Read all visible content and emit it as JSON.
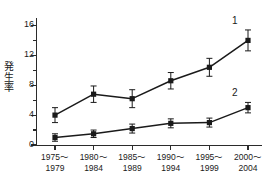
{
  "chart_data": {
    "type": "line",
    "title": "",
    "xlabel": "",
    "ylabel": "発生率",
    "ylim": [
      0,
      17
    ],
    "grid": false,
    "legend_position": "inline-right",
    "categories": [
      "1975~\n1979",
      "1980~\n1984",
      "1985~\n1989",
      "1990~\n1994",
      "1995~\n1999",
      "2000~\n2004"
    ],
    "category_lines": [
      [
        "1975〜",
        "1979"
      ],
      [
        "1980〜",
        "1984"
      ],
      [
        "1985〜",
        "1989"
      ],
      [
        "1990〜",
        "1994"
      ],
      [
        "1995〜",
        "1999"
      ],
      [
        "2000〜",
        "2004"
      ]
    ],
    "ytick_major": [
      0,
      4,
      8,
      12,
      16
    ],
    "ytick_minor": [
      2,
      6,
      10,
      14
    ],
    "series": [
      {
        "name": "1",
        "label": "1",
        "marker": "square",
        "color": "#1a1a1a",
        "values": [
          4.0,
          6.8,
          6.2,
          8.6,
          10.4,
          14.0
        ],
        "errors": [
          1.0,
          1.1,
          1.2,
          1.1,
          1.2,
          1.4
        ]
      },
      {
        "name": "2",
        "label": "2",
        "marker": "square",
        "color": "#1a1a1a",
        "values": [
          1.0,
          1.5,
          2.2,
          2.9,
          3.0,
          5.0
        ],
        "errors": [
          0.5,
          0.5,
          0.6,
          0.6,
          0.6,
          0.7
        ]
      }
    ]
  },
  "axis": {
    "ylabel_chars": [
      "発",
      "生",
      "率"
    ]
  }
}
